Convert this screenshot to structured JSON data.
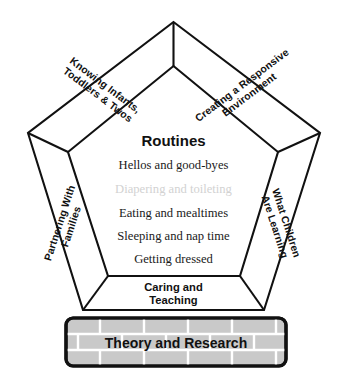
{
  "diagram": {
    "center": {
      "heading": "Routines",
      "items": [
        {
          "label": "Hellos and good-byes",
          "muted": false
        },
        {
          "label": "Diapering and toileting",
          "muted": true
        },
        {
          "label": "Eating and mealtimes",
          "muted": false
        },
        {
          "label": "Sleeping and nap time",
          "muted": false
        },
        {
          "label": "Getting dressed",
          "muted": false
        }
      ]
    },
    "bands": {
      "upper_left": {
        "line1": "Knowing Infants,",
        "line2": "Toddlers & Twos"
      },
      "upper_right": {
        "line1": "Creating a Responsive",
        "line2": "Environment"
      },
      "left": {
        "line1": "Partnering With",
        "line2": "Families"
      },
      "right": {
        "line1": "What Children",
        "line2": "Are Learning"
      },
      "bottom": {
        "line1": "Caring and",
        "line2": "Teaching"
      }
    },
    "foundation": {
      "label": "Theory and Research"
    },
    "colors": {
      "outline": "#111111",
      "panel_fill": "#ffffff",
      "muted_text": "#d2d2d2",
      "brick_fill": "#c9c9c9",
      "mortar": "#ffffff",
      "text": "#111111"
    }
  }
}
